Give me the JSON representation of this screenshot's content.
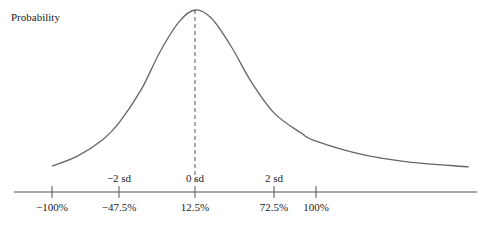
{
  "chart_data": {
    "type": "line",
    "title": "",
    "ylabel": "Probability",
    "xlabel": "",
    "x_ticks": [
      {
        "value": -100,
        "label": "−100%",
        "sd_label": ""
      },
      {
        "value": -47.5,
        "label": "−47.5%",
        "sd_label": "−2 sd"
      },
      {
        "value": 12.5,
        "label": "12.5%",
        "sd_label": "0 sd"
      },
      {
        "value": 72.5,
        "label": "72.5%",
        "sd_label": "2 sd"
      },
      {
        "value": 100,
        "label": "100%",
        "sd_label": ""
      }
    ],
    "mode_x": 12.5,
    "xlim": [
      -130,
      280
    ],
    "series": [
      {
        "name": "density",
        "x": [
          -100,
          -80,
          -60,
          -47.5,
          -30,
          -15,
          0,
          12.5,
          25,
          40,
          55,
          72.5,
          90,
          100,
          130,
          160,
          200,
          240,
          270
        ],
        "y": [
          0.06,
          0.12,
          0.22,
          0.32,
          0.52,
          0.75,
          0.93,
          1.0,
          0.95,
          0.78,
          0.57,
          0.38,
          0.26,
          0.21,
          0.13,
          0.085,
          0.055,
          0.04,
          0.035
        ]
      }
    ],
    "grid": false,
    "legend": "none",
    "colors": {
      "curve": "#666666",
      "axis": "#555555",
      "mode_line": "#555555"
    }
  }
}
